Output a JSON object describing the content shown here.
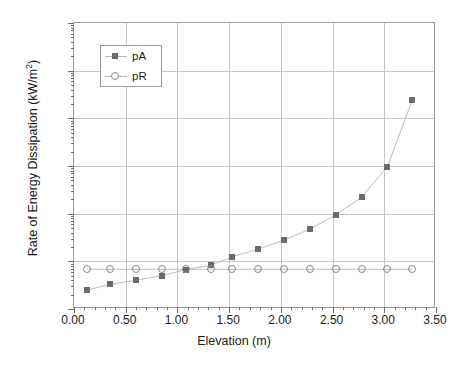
{
  "chart_data": {
    "type": "scatter",
    "title": "",
    "xlabel": "Elevation (m)",
    "ylabel_parts": {
      "pre": "Rate of Energy Dissipation (kW/m",
      "sup": "2",
      "post": ")"
    },
    "ylabel": "Rate of Energy Dissipation (kW/m2)",
    "xlim": [
      0.0,
      3.5
    ],
    "ylim": [
      0.001,
      1000
    ],
    "yscale": "log",
    "xscale": "linear",
    "grid": true,
    "legend_position": "upper-left-inside",
    "xticks": [
      "0.00",
      "0.50",
      "1.00",
      "1.50",
      "2.00",
      "2.50",
      "3.00",
      "3.50"
    ],
    "xtick_values": [
      0.0,
      0.5,
      1.0,
      1.5,
      2.0,
      2.5,
      3.0,
      3.5
    ],
    "yticks": [
      "0.001",
      "0.01",
      "0.1",
      "1",
      "10",
      "100",
      "1000"
    ],
    "ytick_values": [
      0.001,
      0.01,
      0.1,
      1,
      10,
      100,
      1000
    ],
    "series": [
      {
        "name": "pA",
        "marker": "filled-square",
        "color": "#6b6b6b",
        "x": [
          0.13,
          0.35,
          0.6,
          0.85,
          1.08,
          1.32,
          1.53,
          1.78,
          2.03,
          2.28,
          2.53,
          2.78,
          3.03,
          3.27
        ],
        "values": [
          0.0025,
          0.0033,
          0.004,
          0.005,
          0.0067,
          0.0082,
          0.0125,
          0.018,
          0.028,
          0.047,
          0.095,
          0.22,
          0.97,
          24.0
        ]
      },
      {
        "name": "pR",
        "marker": "open-circle",
        "color": "#8a8a8a",
        "x": [
          0.13,
          0.35,
          0.6,
          0.85,
          1.08,
          1.32,
          1.53,
          1.78,
          2.03,
          2.28,
          2.53,
          2.78,
          3.03,
          3.27
        ],
        "values": [
          0.0068,
          0.0068,
          0.0068,
          0.0068,
          0.0068,
          0.0068,
          0.0068,
          0.0068,
          0.0068,
          0.0068,
          0.0068,
          0.0068,
          0.0068,
          0.0068
        ]
      }
    ]
  },
  "legend": {
    "entries": [
      {
        "label": "pA"
      },
      {
        "label": "pR"
      }
    ]
  }
}
